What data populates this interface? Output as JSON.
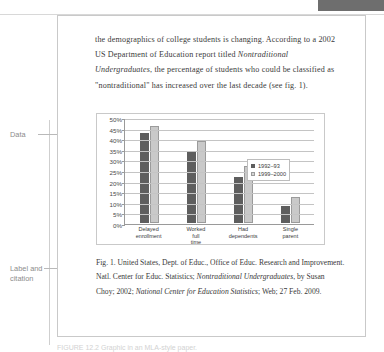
{
  "document": {
    "body_paragraph_html": "the demographics of college students is changing. According to a 2002 US Department of Education report titled <em>Nontraditional Undergraduates</em>, the percentage of students who could be classified as \"nontraditional\" has increased over the last decade (see fig. 1).",
    "caption_html": "Fig. 1. United States, Dept. of Educ., Office of Educ. Research and Improvement. Natl. Center for Educ. Statistics; <em>Nontraditional Undergraduates</em>, by Susan Choy; 2002; <em>National Center for Education Statistics</em>; Web; 27 Feb. 2009."
  },
  "annotations": {
    "data_label": "Data",
    "label_citation_line1": "Label and",
    "label_citation_line2": "citation"
  },
  "figure_strip": {
    "text": "FIGURE 12.2  Graphic in an MLA-style paper."
  },
  "chart_data": {
    "type": "bar",
    "title": "",
    "xlabel": "",
    "ylabel": "",
    "ylim": [
      0,
      50
    ],
    "grid": true,
    "legend_position": "right-inside",
    "y_ticks": [
      "0%",
      "5%",
      "10%",
      "15%",
      "20%",
      "25%",
      "30%",
      "35%",
      "40%",
      "45%",
      "50%"
    ],
    "y_tick_values": [
      0,
      5,
      10,
      15,
      20,
      25,
      30,
      35,
      40,
      45,
      50
    ],
    "categories": [
      "Delayed enrollment",
      "Worked full time",
      "Had dependents",
      "Single parent"
    ],
    "category_lines": [
      [
        "Delayed",
        "enrollment"
      ],
      [
        "Worked",
        "full",
        "time"
      ],
      [
        "Had",
        "dependents"
      ],
      [
        "Single",
        "parent"
      ]
    ],
    "series": [
      {
        "name": "1992–93",
        "color": "#5e5e5e",
        "values": [
          43,
          34,
          22,
          8
        ]
      },
      {
        "name": "1999–2000",
        "color": "#c9c9c9",
        "values": [
          46,
          39,
          27,
          12.5
        ]
      }
    ]
  },
  "colors": {
    "series_1992": "#5e5e5e",
    "series_1999": "#c9c9c9",
    "page_border": "#c9c9c9",
    "corner_tab": "#6e6e6e",
    "annotation_text": "#8c8c8c",
    "body_text": "#3a3a3a"
  }
}
